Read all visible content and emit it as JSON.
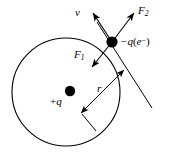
{
  "figure": {
    "background_color": "#ffffff",
    "stroke_color": "#000000",
    "width": 171,
    "height": 166
  },
  "orbit": {
    "name": "circular-orbit-path",
    "center_x": 66,
    "center_y": 92,
    "radius": 54,
    "stroke_width": 1.1
  },
  "charges": {
    "center": {
      "label": "+q",
      "label_sign": "+",
      "label_symbol": "q",
      "x": 70,
      "y": 91,
      "dot_radius": 5.2
    },
    "orbiting": {
      "label": "-q(e-)",
      "label_sign": "−",
      "label_symbol": "q",
      "label_paren_open": "(",
      "label_species": "e",
      "label_species_charge": "−",
      "label_paren_close": ")",
      "x": 112,
      "y": 42,
      "dot_radius": 5.6
    }
  },
  "vectors": {
    "velocity": {
      "label": "v",
      "from_x": 112,
      "from_y": 42,
      "to_x": 92,
      "to_y": 12
    },
    "force_attractive": {
      "label": "F",
      "subscript": "1",
      "from_x": 112,
      "from_y": 42,
      "to_x": 91,
      "to_y": 68
    },
    "force_other": {
      "label": "F",
      "subscript": "2",
      "from_x": 112,
      "from_y": 42,
      "to_x": 135,
      "to_y": 12
    }
  },
  "radius_measure": {
    "label": "r",
    "from_x": 81,
    "from_y": 113,
    "to_x": 124,
    "to_y": 70,
    "double_headed": true
  },
  "tangent_line": {
    "name": "tangent-line",
    "from_x": 97,
    "from_y": 22,
    "to_x": 152,
    "to_y": 108
  },
  "extension_line": {
    "name": "radius-extension-line",
    "from_x": 81,
    "from_y": 113,
    "to_x": 96,
    "to_y": 130
  }
}
